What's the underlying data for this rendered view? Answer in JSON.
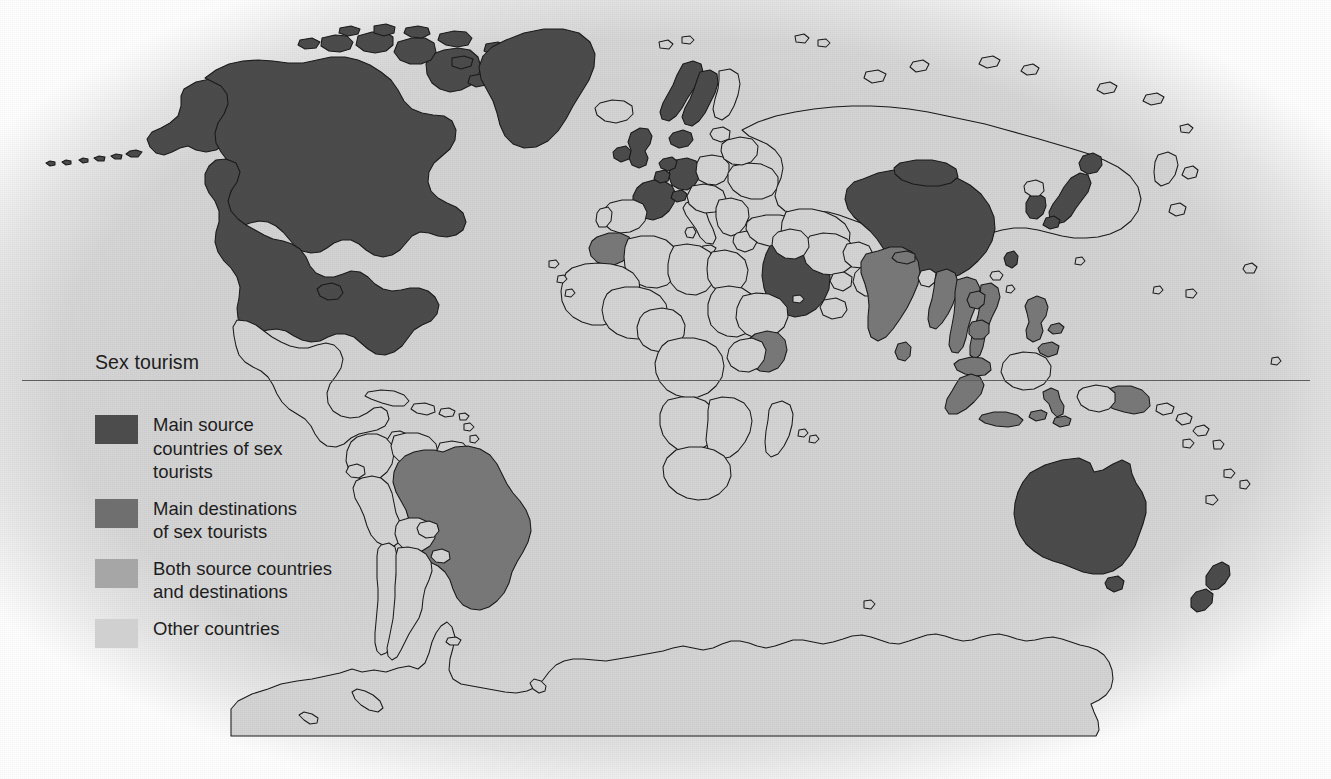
{
  "title": "Sex tourism",
  "legend": {
    "items": [
      {
        "key": "source",
        "label": "Main source\ncountries of sex\ntourists",
        "color": "#4c4c4c"
      },
      {
        "key": "dest",
        "label": "Main destinations\nof sex tourists",
        "color": "#6f6f6f"
      },
      {
        "key": "both",
        "label": "Both source countries\nand destinations",
        "color": "#a6a6a6"
      },
      {
        "key": "other",
        "label": "Other countries",
        "color": "#d0d0d0"
      }
    ]
  },
  "map": {
    "projection": "robinson",
    "background_color": "#d3d3d3",
    "border_color": "#1a1a1a",
    "categories": {
      "source": "Main source countries of sex tourists",
      "dest": "Main destinations of sex tourists",
      "both": "Both source countries and destinations",
      "other": "Other countries"
    },
    "source_countries": [
      "United States",
      "Canada",
      "Greenland",
      "United Kingdom",
      "Ireland",
      "France",
      "Germany",
      "Netherlands",
      "Belgium",
      "Switzerland",
      "Norway",
      "Sweden",
      "Denmark",
      "Finland",
      "Saudi Arabia",
      "China",
      "Japan",
      "South Korea",
      "Taiwan",
      "Australia",
      "New Zealand"
    ],
    "destination_countries": [
      "Brazil",
      "Morocco",
      "Kenya",
      "India",
      "Sri Lanka",
      "Nepal",
      "Thailand",
      "Vietnam",
      "Cambodia",
      "Laos",
      "Myanmar",
      "Philippines",
      "Indonesia",
      "Malaysia",
      "Cuba",
      "Dominican Republic"
    ],
    "both_countries": [],
    "antarctica": "Other countries"
  }
}
